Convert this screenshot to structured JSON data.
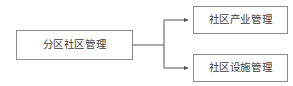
{
  "diagram": {
    "type": "hierarchy-tree",
    "orientation": "left-to-right",
    "background_color": "#ffffff",
    "border_color": "#8c8c8c",
    "text_color": "#3b3b3b",
    "connector_color": "#666666",
    "root": {
      "label": "分区社区管理"
    },
    "children": [
      {
        "label": "社区产业管理"
      },
      {
        "label": "社区设施管理"
      }
    ],
    "connectors": [
      {
        "from": "分区社区管理",
        "to": "社区产业管理",
        "arrow": "solid-triangle"
      },
      {
        "from": "分区社区管理",
        "to": "社区设施管理",
        "arrow": "solid-triangle"
      }
    ]
  }
}
